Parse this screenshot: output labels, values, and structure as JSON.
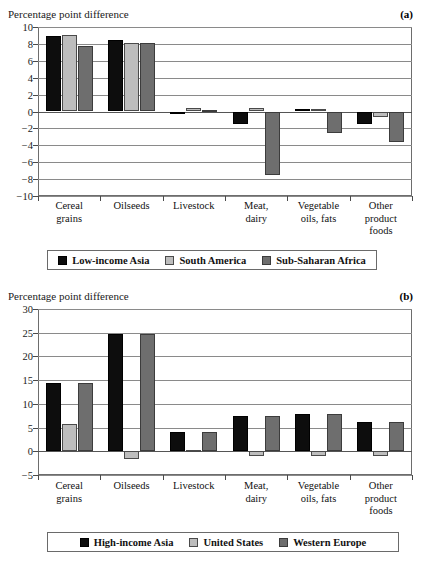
{
  "panels": [
    {
      "tag": "(a)",
      "ylabel": "Percentage point difference",
      "legend": [
        {
          "name": "Low-income Asia",
          "swatch": "black-swatch"
        },
        {
          "name": "South America",
          "swatch": "light-gray-swatch"
        },
        {
          "name": "Sub-Saharan Africa",
          "swatch": "dark-gray-swatch"
        }
      ]
    },
    {
      "tag": "(b)",
      "ylabel": "Percentage point difference",
      "legend": [
        {
          "name": "High-income Asia",
          "swatch": "black-swatch"
        },
        {
          "name": "United States",
          "swatch": "light-gray-swatch"
        },
        {
          "name": "Western Europe",
          "swatch": "dark-gray-swatch"
        }
      ]
    }
  ],
  "chart_data": [
    {
      "type": "bar",
      "title": "",
      "panel": "(a)",
      "xlabel": "",
      "ylabel": "Percentage point difference",
      "ylim": [
        -10,
        10
      ],
      "yticks": [
        10,
        8,
        6,
        4,
        2,
        0,
        -2,
        -4,
        -6,
        -8,
        -10
      ],
      "ytick_labels": [
        "10",
        "8",
        "6",
        "4",
        "2",
        "0",
        "−2",
        "−4",
        "−6",
        "−8",
        "−10"
      ],
      "grid": true,
      "legend_position": "bottom",
      "categories": [
        "Cereal\ngrains",
        "Oilseeds",
        "Livestock",
        "Meat,\ndairy",
        "Vegetable\noils, fats",
        "Other\nproduct\nfoods"
      ],
      "series": [
        {
          "name": "Low-income Asia",
          "color": "#0d0d0d",
          "values": [
            8.9,
            8.5,
            -0.2,
            -1.5,
            0.3,
            -1.5
          ]
        },
        {
          "name": "South America",
          "color": "#bdbdbd",
          "values": [
            9.0,
            8.1,
            0.4,
            0.4,
            0.3,
            -0.6
          ]
        },
        {
          "name": "Sub-Saharan Africa",
          "color": "#6e6e6e",
          "values": [
            7.7,
            8.1,
            0.2,
            -7.5,
            -2.5,
            -3.6
          ]
        }
      ]
    },
    {
      "type": "bar",
      "title": "",
      "panel": "(b)",
      "xlabel": "",
      "ylabel": "Percentage point difference",
      "ylim": [
        -5,
        30
      ],
      "yticks": [
        30,
        25,
        20,
        15,
        10,
        5,
        0,
        -5
      ],
      "ytick_labels": [
        "30",
        "25",
        "20",
        "15",
        "10",
        "5",
        "0",
        "−5"
      ],
      "grid": true,
      "legend_position": "bottom",
      "categories": [
        "Cereal\ngrains",
        "Oilseeds",
        "Livestock",
        "Meat,\ndairy",
        "Vegetable\noils, fats",
        "Other\nproduct\nfoods"
      ],
      "series": [
        {
          "name": "High-income Asia",
          "color": "#0d0d0d",
          "values": [
            14.3,
            24.7,
            4.1,
            7.4,
            7.9,
            6.1
          ]
        },
        {
          "name": "United States",
          "color": "#bdbdbd",
          "values": [
            5.7,
            -1.7,
            0.2,
            -1.0,
            -1.0,
            -1.0
          ]
        },
        {
          "name": "Western Europe",
          "color": "#6e6e6e",
          "values": [
            14.3,
            24.7,
            4.1,
            7.4,
            7.9,
            6.1
          ]
        }
      ]
    }
  ]
}
